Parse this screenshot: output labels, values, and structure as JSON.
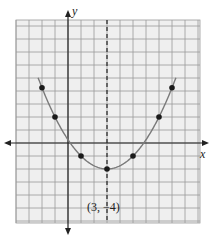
{
  "chart_data": {
    "type": "line",
    "title": "",
    "xlabel": "x",
    "ylabel": "y",
    "function": "y = 0.5(x - 3)^2 - 4",
    "axis_of_symmetry": "x = 3 (dashed)",
    "grid": true,
    "xlim": [
      -4,
      10
    ],
    "ylim": [
      -6,
      9.5
    ],
    "points": [
      {
        "x": -2,
        "y": 8.5
      },
      {
        "x": -1,
        "y": 4
      },
      {
        "x": 1,
        "y": -2
      },
      {
        "x": 3,
        "y": -4
      },
      {
        "x": 5,
        "y": -2
      },
      {
        "x": 7,
        "y": 4
      },
      {
        "x": 8,
        "y": 8.5
      }
    ],
    "annotations": [
      {
        "text": "(3, −4)",
        "x": 3,
        "y": -4
      }
    ]
  },
  "labels": {
    "x_axis": "x",
    "y_axis": "y",
    "vertex": "(3, −4)"
  },
  "colors": {
    "grid_bg": "#efefef",
    "grid_line": "#9a9a9a",
    "axis": "#222222",
    "curve": "#7a7a7a",
    "point": "#1a1a1a"
  }
}
